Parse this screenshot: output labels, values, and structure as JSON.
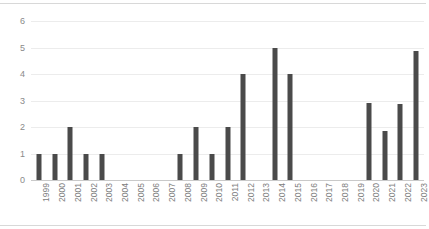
{
  "chart_data": {
    "type": "bar",
    "title": "",
    "subtitle": "",
    "xlabel": "",
    "ylabel": "",
    "ylim": [
      0,
      6
    ],
    "yticks": [
      0,
      1,
      2,
      3,
      4,
      5,
      6
    ],
    "grid": true,
    "legend": false,
    "legend_position": "none",
    "bar_color": "#4a4a4a",
    "gridline_color": "#ececec",
    "axis_color": "#c9c9c9",
    "tick_label_color": "#8a8a8a",
    "x_label_rotation": -90,
    "categories": [
      "1999",
      "2000",
      "2001",
      "2002",
      "2003",
      "2004",
      "2005",
      "2006",
      "2007",
      "2008",
      "2009",
      "2010",
      "2011",
      "2012",
      "2013",
      "2014",
      "2015",
      "2016",
      "2017",
      "2018",
      "2019",
      "2020",
      "2021",
      "2022",
      "2023"
    ],
    "values": [
      1,
      1,
      2,
      1,
      1,
      0,
      0,
      0,
      0,
      1,
      2,
      1,
      2,
      4,
      0,
      5,
      4,
      0,
      0,
      0,
      0,
      2.9,
      1.85,
      2.85,
      4.85
    ]
  }
}
